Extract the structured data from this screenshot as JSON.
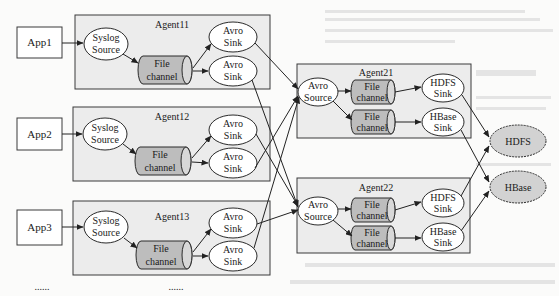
{
  "apps": [
    {
      "label": "App1"
    },
    {
      "label": "App2"
    },
    {
      "label": "App3"
    }
  ],
  "first_tier_agents": [
    {
      "title": "Agent11",
      "source": [
        "Syslog",
        "Source"
      ],
      "channel": [
        "File",
        "channel"
      ],
      "sinks": [
        [
          "Avro",
          "Sink"
        ],
        [
          "Avro",
          "Sink"
        ]
      ]
    },
    {
      "title": "Agent12",
      "source": [
        "Syslog",
        "Source"
      ],
      "channel": [
        "File",
        "channel"
      ],
      "sinks": [
        [
          "Avro",
          "Sink"
        ],
        [
          "Avro",
          "Sink"
        ]
      ]
    },
    {
      "title": "Agent13",
      "source": [
        "Syslog",
        "Source"
      ],
      "channel": [
        "File",
        "channel"
      ],
      "sinks": [
        [
          "Avro",
          "Sink"
        ],
        [
          "Avro",
          "Sink"
        ]
      ]
    }
  ],
  "second_tier_agents": [
    {
      "title": "Agent21",
      "source": [
        "Avro",
        "Source"
      ],
      "channels": [
        [
          "File",
          "channel"
        ],
        [
          "File",
          "channel"
        ]
      ],
      "sinks": [
        [
          "HDFS",
          "Sink"
        ],
        [
          "HBase",
          "Sink"
        ]
      ]
    },
    {
      "title": "Agent22",
      "source": [
        "Avro",
        "Source"
      ],
      "channels": [
        [
          "File",
          "channel"
        ],
        [
          "File",
          "channel"
        ]
      ],
      "sinks": [
        [
          "HDFS",
          "Sink"
        ],
        [
          "HBase",
          "Sink"
        ]
      ]
    }
  ],
  "stores": [
    {
      "label": "HDFS"
    },
    {
      "label": "HBase"
    }
  ],
  "continuation": [
    "......",
    "......"
  ],
  "connections": [
    {
      "from": "Agent11.sink1",
      "to": "Agent21.source"
    },
    {
      "from": "Agent11.sink2",
      "to": "Agent22.source"
    },
    {
      "from": "Agent12.sink1",
      "to": "Agent22.source"
    },
    {
      "from": "Agent12.sink2",
      "to": "Agent21.source"
    },
    {
      "from": "Agent13.sink1",
      "to": "Agent22.source"
    },
    {
      "from": "Agent13.sink2",
      "to": "Agent21.source"
    },
    {
      "from": "Agent21.hdfs_sink",
      "to": "HDFS"
    },
    {
      "from": "Agent21.hbase_sink",
      "to": "HBase"
    },
    {
      "from": "Agent22.hdfs_sink",
      "to": "HDFS"
    },
    {
      "from": "Agent22.hbase_sink",
      "to": "HBase"
    }
  ]
}
